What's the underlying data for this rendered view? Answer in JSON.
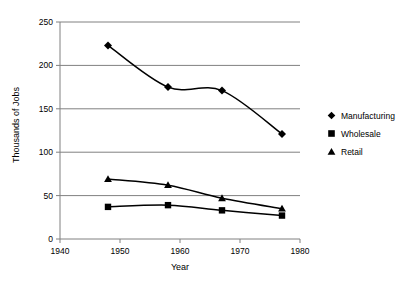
{
  "chart_data": {
    "type": "line",
    "title": "",
    "xlabel": "Year",
    "ylabel": "Thousands of Jobs",
    "xlim": [
      1940,
      1980
    ],
    "ylim": [
      0,
      250
    ],
    "xticks": [
      1940,
      1950,
      1960,
      1970,
      1980
    ],
    "yticks": [
      0,
      50,
      100,
      150,
      200,
      250
    ],
    "grid": "horizontal",
    "legend_position": "right",
    "x": [
      1948,
      1958,
      1967,
      1977
    ],
    "series": [
      {
        "name": "Manufacturing",
        "marker": "diamond",
        "values": [
          223,
          175,
          171,
          121
        ]
      },
      {
        "name": "Wholesale",
        "marker": "square",
        "values": [
          37,
          39,
          33,
          27
        ]
      },
      {
        "name": "Retail",
        "marker": "triangle",
        "values": [
          69,
          62,
          47,
          35
        ]
      }
    ]
  },
  "legend": {
    "items": [
      {
        "label": "Manufacturing",
        "marker": "diamond-marker"
      },
      {
        "label": "Wholesale",
        "marker": "square-marker"
      },
      {
        "label": "Retail",
        "marker": "triangle-marker"
      }
    ]
  }
}
